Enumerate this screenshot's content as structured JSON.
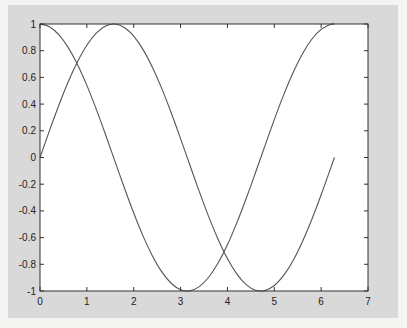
{
  "chart_data": {
    "type": "line",
    "title": "",
    "xlabel": "",
    "ylabel": "",
    "xlim": [
      0,
      7
    ],
    "ylim": [
      -1,
      1
    ],
    "grid": false,
    "legend": null,
    "x_ticks": [
      "0",
      "1",
      "2",
      "3",
      "4",
      "5",
      "6",
      "7"
    ],
    "y_ticks": [
      "1",
      "0.8",
      "0.6",
      "0.4",
      "0.2",
      "0",
      "-0.2",
      "-0.4",
      "-0.6",
      "-0.8",
      "-1"
    ],
    "x": [
      0,
      0.2,
      0.4,
      0.6,
      0.8,
      1.0,
      1.2,
      1.4,
      1.6,
      1.8,
      2.0,
      2.2,
      2.4,
      2.6,
      2.8,
      3.0,
      3.2,
      3.4,
      3.6,
      3.8,
      4.0,
      4.2,
      4.4,
      4.6,
      4.8,
      5.0,
      5.2,
      5.4,
      5.6,
      5.8,
      6.0,
      6.2,
      6.283
    ],
    "series": [
      {
        "name": "sin(x)",
        "color": "#555555",
        "values": [
          0,
          0.199,
          0.389,
          0.565,
          0.717,
          0.841,
          0.932,
          0.985,
          1.0,
          0.974,
          0.909,
          0.808,
          0.675,
          0.516,
          0.335,
          0.141,
          -0.058,
          -0.256,
          -0.443,
          -0.612,
          -0.757,
          -0.872,
          -0.952,
          -0.994,
          -0.996,
          -0.959,
          -0.883,
          -0.773,
          -0.631,
          -0.465,
          -0.279,
          -0.083,
          0
        ]
      },
      {
        "name": "cos(x)",
        "color": "#555555",
        "values": [
          1,
          0.98,
          0.921,
          0.825,
          0.697,
          0.54,
          0.362,
          0.17,
          -0.029,
          -0.227,
          -0.416,
          -0.589,
          -0.737,
          -0.857,
          -0.942,
          -0.99,
          -0.998,
          -0.967,
          -0.897,
          -0.791,
          -0.654,
          -0.49,
          -0.307,
          -0.112,
          0.087,
          0.284,
          0.469,
          0.635,
          0.776,
          0.886,
          0.96,
          0.997,
          1
        ]
      }
    ]
  },
  "colors": {
    "figure_bg": "#d9d9d9",
    "axes_bg": "#ffffff",
    "line": "#555555",
    "axis": "#333333"
  }
}
